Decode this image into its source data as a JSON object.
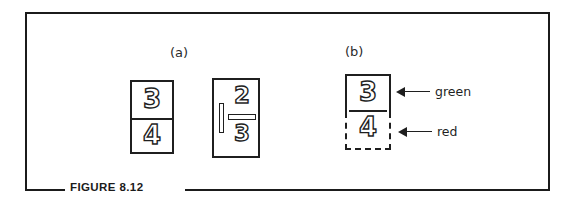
{
  "figure": {
    "caption": "FIGURE 8.12",
    "frame_color": "#1b1b1b",
    "background": "#ffffff"
  },
  "panels": [
    {
      "id": "a",
      "label": "(a)",
      "boxes": [
        {
          "id": "a1",
          "kind": "stacked-fraction",
          "numerator": "3",
          "denominator": "4",
          "border": "solid"
        },
        {
          "id": "a2",
          "kind": "fraction-with-cursor",
          "numerator": "2",
          "denominator": "3",
          "cursor": "insertion-bar",
          "border": "solid"
        }
      ]
    },
    {
      "id": "b",
      "label": "(b)",
      "boxes": [
        {
          "id": "b-top",
          "kind": "region-cell",
          "value": "3",
          "border": "solid",
          "annotation": "green",
          "annotation_color": "#008000"
        },
        {
          "id": "b-bottom",
          "kind": "region-cell",
          "value": "4",
          "border": "dashed",
          "annotation": "red",
          "annotation_color": "#cc0000"
        }
      ]
    }
  ],
  "annotations": [
    {
      "id": "green",
      "text": "green",
      "arrow": "left-arrow"
    },
    {
      "id": "red",
      "text": "red",
      "arrow": "left-arrow"
    }
  ]
}
